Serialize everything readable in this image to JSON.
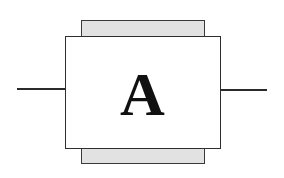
{
  "diagram": {
    "component": {
      "label": "A",
      "fill": "#ffffff",
      "stroke": "#2e2e2e"
    },
    "pads": {
      "top": {
        "fill": "#e2e2e2",
        "pattern": "stippled"
      },
      "bottom": {
        "fill": "#e2e2e2",
        "pattern": "stippled"
      }
    },
    "leads": {
      "left": {
        "color": "#2a2a2a"
      },
      "right": {
        "color": "#2a2a2a"
      }
    }
  }
}
